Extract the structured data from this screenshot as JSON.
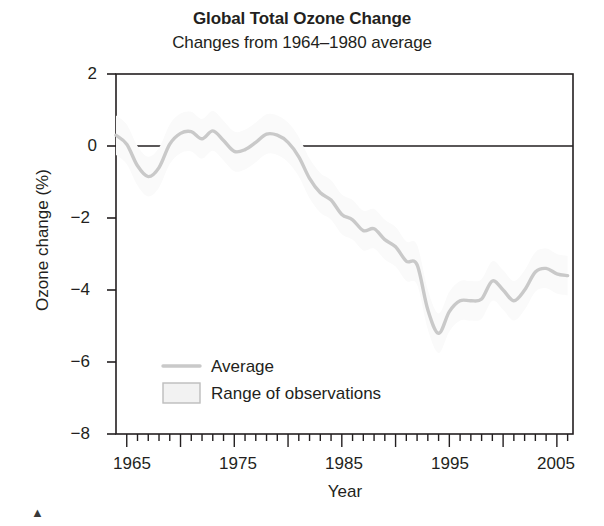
{
  "chart_data": {
    "type": "line",
    "title": "Global Total Ozone Change",
    "subtitle": "Changes from 1964–1980 average",
    "xlabel": "Year",
    "ylabel": "Ozone change (%)",
    "xlim": [
      1964,
      2006.5
    ],
    "ylim": [
      -8,
      2
    ],
    "yticks": [
      2,
      0,
      -2,
      -4,
      -6,
      -8
    ],
    "ytick_labels": [
      "2",
      "0",
      "−2",
      "−4",
      "−6",
      "−8"
    ],
    "xticks": [
      1965,
      1975,
      1985,
      1995,
      2005
    ],
    "xtick_labels": [
      "1965",
      "1975",
      "1985",
      "1995",
      "2005"
    ],
    "minor_tick_interval": 1,
    "major_tick_interval": 5,
    "grid": false,
    "zero_reference_line": 0,
    "legend": {
      "position": "inside-lower-left",
      "entries": [
        {
          "label": "Average",
          "marker": "line",
          "color": "#c9c9c9"
        },
        {
          "label": "Range of observations",
          "marker": "box",
          "color": "#f2f2f2",
          "border": "#bdbdbd"
        }
      ]
    },
    "series": [
      {
        "name": "Average",
        "color": "#c9c9c9",
        "x": [
          1964,
          1965,
          1966,
          1967,
          1968,
          1969,
          1970,
          1971,
          1972,
          1973,
          1974,
          1975,
          1976,
          1977,
          1978,
          1979,
          1980,
          1981,
          1982,
          1983,
          1984,
          1985,
          1986,
          1987,
          1988,
          1989,
          1990,
          1991,
          1992,
          1993,
          1994,
          1995,
          1996,
          1997,
          1998,
          1999,
          2000,
          2001,
          2002,
          2003,
          2004,
          2005,
          2006
        ],
        "y": [
          0.3,
          0.05,
          -0.55,
          -0.85,
          -0.6,
          0.05,
          0.35,
          0.4,
          0.2,
          0.42,
          0.15,
          -0.15,
          -0.1,
          0.1,
          0.33,
          0.3,
          0.1,
          -0.3,
          -0.9,
          -1.3,
          -1.5,
          -1.9,
          -2.05,
          -2.35,
          -2.3,
          -2.6,
          -2.8,
          -3.2,
          -3.3,
          -4.55,
          -5.2,
          -4.6,
          -4.3,
          -4.3,
          -4.25,
          -3.75,
          -4.0,
          -4.3,
          -4.0,
          -3.5,
          -3.4,
          -3.55,
          -3.6
        ]
      }
    ]
  },
  "figure": {
    "corner_mark": "▲"
  }
}
